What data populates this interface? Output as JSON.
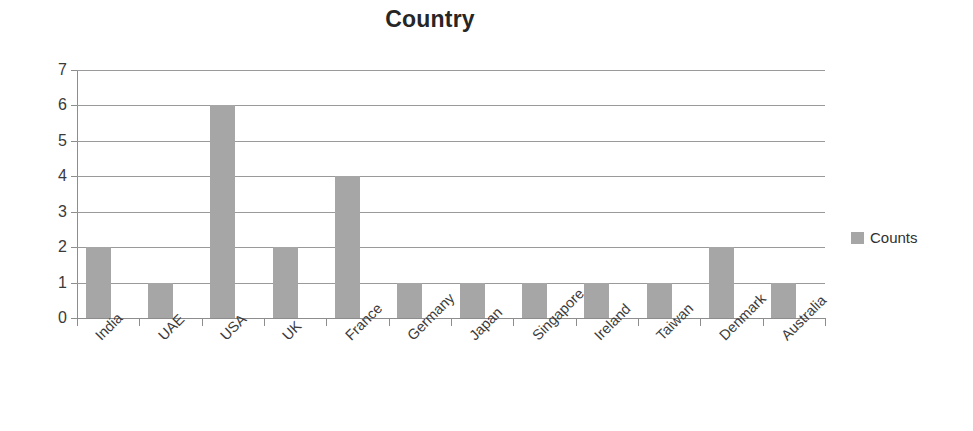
{
  "chart_data": {
    "type": "bar",
    "title": "Country",
    "xlabel": "",
    "ylabel": "",
    "categories": [
      "India",
      "UAE",
      "USA",
      "UK",
      "France",
      "Germany",
      "Japan",
      "Singapore",
      "Ireland",
      "Taiwan",
      "Denmark",
      "Australia"
    ],
    "series": [
      {
        "name": "Counts",
        "values": [
          2,
          1,
          6,
          2,
          4,
          1,
          1,
          1,
          1,
          1,
          2,
          1
        ],
        "color": "#a6a6a6"
      }
    ],
    "ylim": [
      0,
      7
    ],
    "y_ticks": [
      0,
      1,
      2,
      3,
      4,
      5,
      6,
      7
    ],
    "y_tick_labels": [
      "0",
      "1",
      "2",
      "3",
      "4",
      "5",
      "6",
      "7"
    ],
    "grid": true,
    "grid_axis": "y",
    "legend": {
      "position": "right",
      "entries": [
        {
          "label": "Counts",
          "color": "#a6a6a6",
          "swatch": "legend-swatch-counts"
        }
      ]
    },
    "axis_color": "#8d8d8d",
    "gridline_color": "#9a9a9a",
    "background": "#ffffff",
    "label_rotation_degrees": -45
  }
}
